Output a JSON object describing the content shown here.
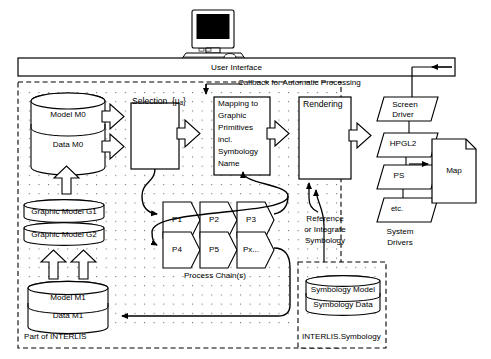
{
  "diagram": {
    "user_interface": {
      "label": "User Interface"
    },
    "callback": {
      "label": "Callback for Automatic Processing"
    },
    "containers": [
      {
        "id": "interlis",
        "label": "Part of INTERLIS"
      },
      {
        "id": "symbology",
        "label": "INTERLIS.Symbology"
      }
    ],
    "datastores": [
      {
        "id": "m0",
        "rows": [
          "Model M0",
          "Data M0"
        ]
      },
      {
        "id": "g1",
        "rows": [
          "Graphic Model G1"
        ]
      },
      {
        "id": "g2",
        "rows": [
          "Graphic Model G2"
        ]
      },
      {
        "id": "m1",
        "rows": [
          "Model M1",
          "Data M1"
        ]
      },
      {
        "id": "sym",
        "rows": [
          "Symbology Model",
          "Symbology Data"
        ]
      }
    ],
    "processes": [
      {
        "id": "selection",
        "label": "Selection",
        "set": "{μₐ}"
      },
      {
        "id": "mapping",
        "lines": [
          "Mapping to",
          "Graphic",
          "Primitives",
          "incl.",
          "Symbology",
          "Name"
        ]
      },
      {
        "id": "rendering",
        "label": "Rendering"
      }
    ],
    "process_chain": {
      "caption": "Process Chain(s)",
      "steps": [
        "P1",
        "P2",
        "P3",
        "P4",
        "P5",
        "Px..."
      ]
    },
    "drivers": {
      "caption": "System Drivers",
      "items": [
        "Screen Driver",
        "HPGL2",
        "PS",
        "etc."
      ]
    },
    "output": {
      "label": "Map"
    },
    "symbology_note": {
      "lines": [
        "Reference",
        "or Integrate",
        "Symbology"
      ]
    }
  },
  "colors": {
    "stroke": "#000000",
    "background": "#ffffff",
    "fill": "#ffffff"
  }
}
